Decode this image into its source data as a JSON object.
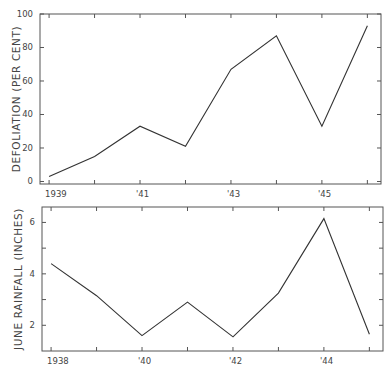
{
  "chart_data": [
    {
      "type": "line",
      "title": "",
      "xlabel": "",
      "ylabel": "DEFOLIATION (PER CENT)",
      "x": [
        1939,
        1940,
        1941,
        1942,
        1943,
        1944,
        1945,
        1946
      ],
      "values": [
        3,
        15,
        33,
        21,
        67,
        87,
        33,
        93
      ],
      "x_tick_labels": [
        "1939",
        "'41",
        "'43",
        "'45"
      ],
      "x_tick_label_positions": [
        1939,
        1941,
        1943,
        1945
      ],
      "y_ticks": [
        0,
        20,
        40,
        60,
        80,
        100
      ],
      "y_tick_labels": [
        "0",
        "20",
        "40",
        "60",
        "80",
        "100"
      ],
      "ylim": [
        -1.5,
        100
      ],
      "xlim": [
        1938.8,
        1946.3
      ],
      "grid": false,
      "legend": null
    },
    {
      "type": "line",
      "title": "",
      "xlabel": "",
      "ylabel": "JUNE RAINFALL (INCHES)",
      "x": [
        1938,
        1939,
        1940,
        1941,
        1942,
        1943,
        1944,
        1945
      ],
      "values": [
        4.4,
        3.15,
        1.6,
        2.9,
        1.55,
        3.25,
        6.15,
        1.65
      ],
      "x_tick_labels": [
        "1938",
        "'40",
        "'42",
        "'44"
      ],
      "x_tick_label_positions": [
        1938,
        1940,
        1942,
        1944
      ],
      "y_ticks": [
        2,
        3,
        4,
        5,
        6
      ],
      "y_tick_labels": [
        "2",
        "",
        "4",
        "",
        "6"
      ],
      "ylim": [
        1,
        6.6
      ],
      "xlim": [
        1937.8,
        1945.3
      ],
      "grid": false,
      "legend": null
    }
  ]
}
